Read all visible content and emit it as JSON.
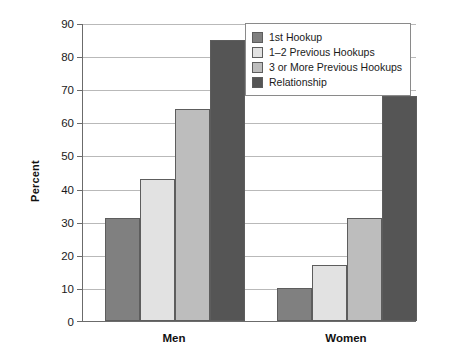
{
  "chart_data": {
    "type": "bar",
    "title": "",
    "subtitle": "",
    "xlabel": "",
    "ylabel": "Percent",
    "categories": [
      "Men",
      "Women"
    ],
    "series": [
      {
        "name": "1st Hookup",
        "values": [
          31,
          10
        ],
        "color": "#808080"
      },
      {
        "name": "1–2 Previous Hookups",
        "values": [
          43,
          17
        ],
        "color": "#e2e2e2"
      },
      {
        "name": "3 or More Previous Hookups",
        "values": [
          64,
          31
        ],
        "color": "#bdbdbd"
      },
      {
        "name": "Relationship",
        "values": [
          85,
          68
        ],
        "color": "#555555"
      }
    ],
    "ylim": [
      0,
      90
    ],
    "yticks": [
      0,
      10,
      20,
      30,
      40,
      50,
      60,
      70,
      80,
      90
    ],
    "ytick_labels": [
      "0",
      "10",
      "20",
      "30",
      "40",
      "50",
      "60",
      "70",
      "80",
      "90"
    ],
    "grid": true,
    "legend_position": "top-right",
    "bar_group_gap": true
  },
  "axis": {
    "y_title": "Percent",
    "y_labels": [
      "90",
      "80",
      "70",
      "60",
      "50",
      "40",
      "30",
      "20",
      "10",
      "0"
    ],
    "x_labels": [
      "Men",
      "Women"
    ]
  },
  "legend": {
    "items": [
      {
        "label": "1st Hookup"
      },
      {
        "label": "1–2 Previous Hookups"
      },
      {
        "label": "3 or More Previous Hookups"
      },
      {
        "label": "Relationship"
      }
    ]
  }
}
